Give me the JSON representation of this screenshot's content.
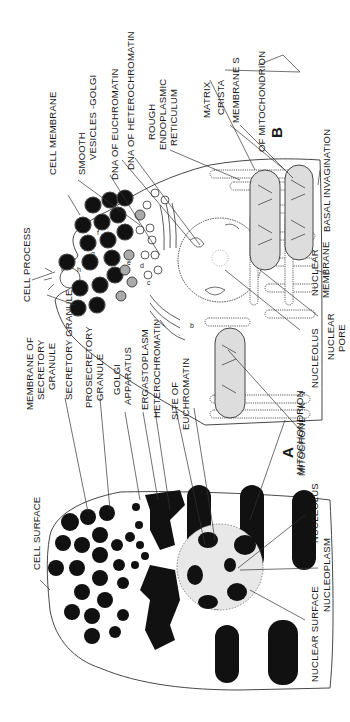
{
  "figure": {
    "orientation": "rotated 90 degrees counter-clockwise",
    "panels": [
      {
        "id": "A",
        "label": "A",
        "description": "Light-microscope schematic of secretory cell",
        "labels": {
          "cell_surface": "CELL  SURFACE",
          "secretory_granule": "SECRETORY GRANULE",
          "prosecretory_granule_1": "PROSECRETORY",
          "prosecretory_granule_2": "GRANULE",
          "golgi_apparatus_1": "GOLGI",
          "golgi_apparatus_2": "APPARATUS",
          "ergastoplasm": "ERGASTOPLASM",
          "heterochromatin": "HETEROCHROMATIN",
          "site_of_euchromatin_1": "SITE OF",
          "site_of_euchromatin_2": "EUCHROMATIN",
          "mitochondrion": "MITOCHONDRION",
          "nucleolus": "NUCLEOLUS",
          "nucleoplasm": "NUCLEOPLASM",
          "nuclear_surface": "NUCLEAR SURFACE"
        }
      },
      {
        "id": "B",
        "label": "B",
        "description": "Electron-microscope schematic of secretory cell",
        "labels": {
          "cell_process": "CELL  PROCESS",
          "membrane_of_secretory_granule_1": "MEMBRANE OF",
          "membrane_of_secretory_granule_2": "SECRETORY",
          "membrane_of_secretory_granule_3": "GRANULE",
          "cell_membrane": "CELL MEMBRANE",
          "smooth_vesicles_golgi_1": "SMOOTH",
          "smooth_vesicles_golgi_2": "VESICLES -GOLGI",
          "dna_of_euchromatin": "DNA OF EUCHROMATIN",
          "dna_of_heterochromatin": "DNA OF HETEROCHROMATIN",
          "rough_er_1": "ROUGH",
          "rough_er_2": "ENDOPLASMIC",
          "rough_er_3": "RETICULUM",
          "matrix": "MATRIX",
          "crista": "CRISTA",
          "membranes": "MEMBRANE S",
          "of_mitochondrion": "OF MITOCHONDRION",
          "basal_invagination": "BASAL  INVAGINATION",
          "nuclear_membrane_1": "NUCLEAR",
          "nuclear_membrane_2": "MEMBRANE",
          "nuclear_pore_1": "NUCLEAR",
          "nuclear_pore_2": "PORE",
          "nucleolus": "NUCLEOLUS",
          "mitochondrion": "MITOCHONDRION"
        },
        "small_letters": [
          "a",
          "b",
          "c",
          "d",
          "e",
          "f",
          "g",
          "h",
          "i"
        ]
      }
    ]
  }
}
